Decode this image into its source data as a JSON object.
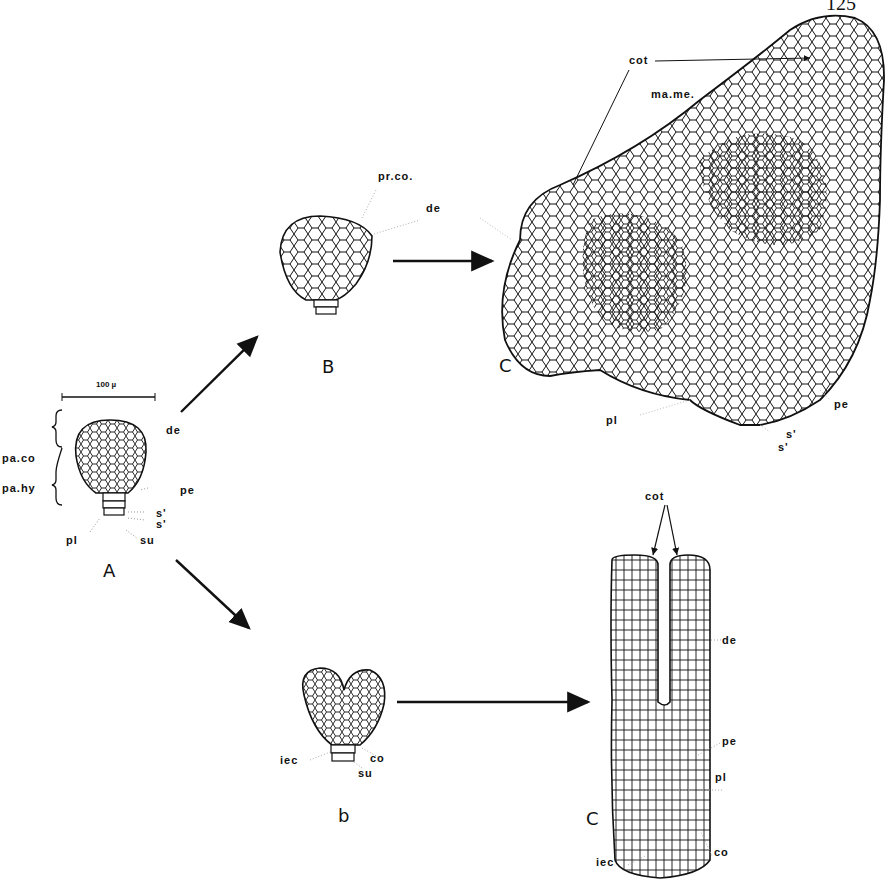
{
  "page_number": "125",
  "scale_bar": {
    "label": "100 µ"
  },
  "stages": {
    "A": {
      "label": "A",
      "annotations": [
        "pa.co",
        "pa.hy",
        "de",
        "pe",
        "s'",
        "s'",
        "pl",
        "su"
      ]
    },
    "B": {
      "label": "B",
      "annotations": [
        "pr.co.",
        "de"
      ]
    },
    "C_upper": {
      "label": "C",
      "annotations": [
        "cot",
        "ma.me.",
        "pl",
        "pe",
        "s'",
        "s'"
      ]
    },
    "b": {
      "label": "b",
      "annotations": [
        "iec",
        "co",
        "su"
      ]
    },
    "C_lower": {
      "label": "C",
      "annotations": [
        "cot",
        "de",
        "pe",
        "pl",
        "iec",
        "co"
      ]
    }
  },
  "labels": {
    "pa_co": "pa.co",
    "pa_hy": "pa.hy",
    "A_de": "de",
    "A_pe": "pe",
    "A_s1": "s'",
    "A_s2": "s'",
    "A_pl": "pl",
    "A_su": "su",
    "B_prco": "pr.co.",
    "B_de": "de",
    "C_cot": "cot",
    "C_mame": "ma.me.",
    "C_pl": "pl",
    "C_pe": "pe",
    "C_s1": "s'",
    "C_s2": "s'",
    "b_iec": "iec",
    "b_co": "co",
    "b_su": "su",
    "c2_cot": "cot",
    "c2_de": "de",
    "c2_pe": "pe",
    "c2_pl": "pl",
    "c2_iec": "iec",
    "c2_co": "co"
  },
  "stage_letters": {
    "A": "A",
    "B": "B",
    "C1": "C",
    "b": "b",
    "C2": "C"
  }
}
